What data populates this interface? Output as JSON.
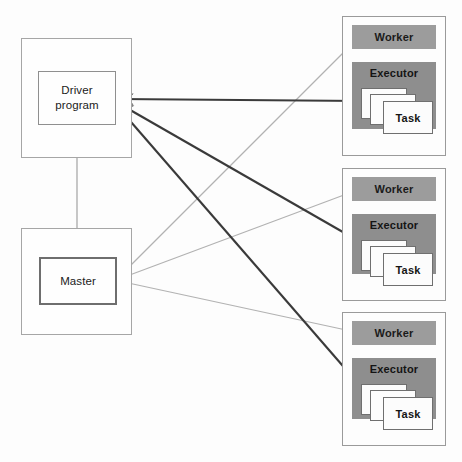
{
  "diagram": {
    "driver": {
      "container_label": "",
      "label_line1": "Driver",
      "label_line2": "program"
    },
    "master": {
      "container_label": "",
      "label": "Master"
    },
    "nodes": [
      {
        "worker_label": "Worker",
        "executor_label": "Executor",
        "task_label": "Task"
      },
      {
        "worker_label": "Worker",
        "executor_label": "Executor",
        "task_label": "Task"
      },
      {
        "worker_label": "Worker",
        "executor_label": "Executor",
        "task_label": "Task"
      }
    ],
    "colors": {
      "worker_bar": "#9c9c9c",
      "executor_box": "#8e8e8e",
      "task_card": "#fcfcfc",
      "dark_arrow": "#3a3a3a",
      "light_arrow": "#b0b0b0",
      "box_border": "#9a9a9a",
      "master_border": "#6e6e6e",
      "background": "#fdfdfd"
    },
    "connections": [
      {
        "from": "driver-program",
        "to": "node-1-executor",
        "style": "dark",
        "arrows": "both"
      },
      {
        "from": "driver-program",
        "to": "node-2-executor",
        "style": "dark",
        "arrows": "both"
      },
      {
        "from": "driver-program",
        "to": "node-3-executor",
        "style": "dark",
        "arrows": "both"
      },
      {
        "from": "master",
        "to": "node-1-worker",
        "style": "light",
        "arrows": "both"
      },
      {
        "from": "master",
        "to": "node-2-worker",
        "style": "light",
        "arrows": "both"
      },
      {
        "from": "master",
        "to": "node-3-worker",
        "style": "light",
        "arrows": "both"
      },
      {
        "from": "master",
        "to": "driver-program",
        "style": "light",
        "arrows": "both"
      }
    ]
  }
}
